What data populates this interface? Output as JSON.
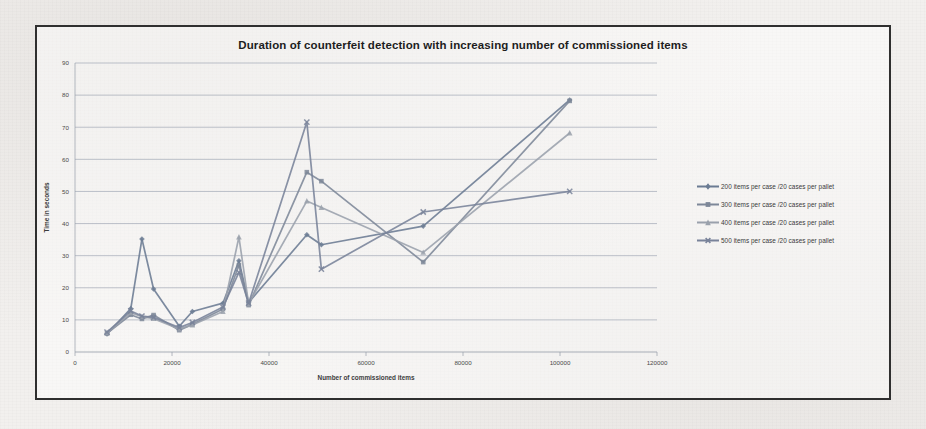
{
  "chart_data": {
    "type": "line",
    "title": "Duration of counterfeit detection with increasing number of commissioned items",
    "xlabel": "Number of commissioned items",
    "ylabel": "Time in seconds",
    "xlim": [
      0,
      120000
    ],
    "ylim": [
      0,
      90
    ],
    "xticks": [
      0,
      20000,
      40000,
      60000,
      80000,
      100000,
      120000
    ],
    "yticks": [
      0,
      10,
      20,
      30,
      40,
      50,
      60,
      70,
      80,
      90
    ],
    "xtick_labels": [
      "0",
      "20000",
      "40000",
      "60000",
      "80000",
      "100000",
      "120000"
    ],
    "ytick_labels": [
      "0",
      "10",
      "20",
      "30",
      "40",
      "50",
      "60",
      "70",
      "80",
      "90"
    ],
    "grid": "horizontal",
    "legend_position": "right",
    "series": [
      {
        "name": "200 items per case /20 cases per pallet",
        "color": "#6b7b93",
        "marker": "diamond",
        "x": [
          6600,
          11500,
          13800,
          16200,
          21500,
          24200,
          30500,
          33800,
          35800,
          47800,
          50800,
          71800,
          102000
        ],
        "y": [
          5.6,
          13.5,
          35.2,
          19.6,
          8.0,
          12.6,
          15.2,
          28.4,
          15.4,
          36.5,
          33.4,
          39.2,
          78.5
        ]
      },
      {
        "name": "300 items per case /20 cases per pallet",
        "color": "#7d8798",
        "marker": "square",
        "x": [
          6600,
          11500,
          13800,
          16200,
          21500,
          24200,
          30500,
          33800,
          35800,
          47800,
          50800,
          71800,
          102000
        ],
        "y": [
          5.8,
          11.6,
          10.3,
          11.5,
          6.8,
          8.6,
          13.4,
          27.0,
          14.6,
          56.0,
          53.2,
          28.0,
          78.2
        ]
      },
      {
        "name": "400 items per case /20 cases per pallet",
        "color": "#9aa1ac",
        "marker": "triangle",
        "x": [
          6600,
          11500,
          13800,
          16200,
          21500,
          24200,
          30500,
          33800,
          35800,
          47800,
          50800,
          71800,
          102000
        ],
        "y": [
          6.0,
          12.2,
          11.0,
          10.4,
          7.2,
          8.4,
          12.6,
          35.8,
          15.0,
          47.0,
          45.0,
          31.0,
          68.2
        ]
      },
      {
        "name": "500 items per case /20 cases per pallet",
        "color": "#79839a",
        "marker": "cross",
        "x": [
          6600,
          11500,
          13800,
          16200,
          21500,
          24200,
          30500,
          33800,
          35800,
          47800,
          50800,
          71800,
          102000
        ],
        "y": [
          6.2,
          12.8,
          11.2,
          10.8,
          7.6,
          9.2,
          14.0,
          24.8,
          15.2,
          71.6,
          25.8,
          43.6,
          50.0
        ]
      }
    ]
  },
  "legend": {
    "items": [
      "200 items per case /20 cases per pallet",
      "300 items per case /20 cases per pallet",
      "400 items per case /20 cases per pallet",
      "500 items per case /20 cases per pallet"
    ]
  },
  "colors": {
    "frame_border": "#2f2f2f",
    "gridline": "#8e97a8",
    "axis": "#9aa0ab",
    "title_text": "#1d1d1d",
    "page_background": "#f2f0ee"
  }
}
